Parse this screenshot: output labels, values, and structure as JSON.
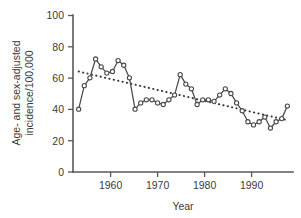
{
  "chart_data": {
    "type": "line",
    "title": "",
    "xlabel": "Year",
    "ylabel": "Age- and sex-adjusted incidence/100,000",
    "ylabel_line1": "Age- and sex-adjusted",
    "ylabel_line2": "incidence/100,000",
    "xlim": [
      1955.0,
      1994.0
    ],
    "ylim": [
      0,
      100
    ],
    "xticks": [
      1960,
      1970,
      1980,
      1990
    ],
    "xtick_labels": [
      "1960",
      "1970",
      "1980",
      "1990"
    ],
    "yticks": [
      0,
      20,
      40,
      60,
      80,
      100
    ],
    "ytick_labels": [
      "0",
      "20",
      "40",
      "60",
      "80",
      "100"
    ],
    "grid": false,
    "legend": "none",
    "marker": "open-circle",
    "series": [
      {
        "name": "Age- and sex-adjusted incidence",
        "style": "solid-line-with-open-circle-markers",
        "color": "#4a4a4c",
        "x": [
          1956,
          1957,
          1958,
          1959,
          1960,
          1961,
          1962,
          1963,
          1964,
          1965,
          1966,
          1967,
          1968,
          1969,
          1970,
          1971,
          1972,
          1973,
          1974,
          1975,
          1976,
          1977,
          1978,
          1979,
          1980,
          1981,
          1982,
          1983,
          1984,
          1985,
          1986,
          1987,
          1988,
          1989,
          1990,
          1991,
          1992,
          1993
        ],
        "values": [
          40,
          55,
          60,
          72,
          67,
          63,
          64,
          71,
          68,
          60,
          40,
          44,
          46,
          46,
          44,
          43,
          46,
          49,
          62,
          56,
          53,
          43,
          46,
          46,
          45,
          49,
          53,
          50,
          44,
          39,
          32,
          30,
          32,
          35,
          28,
          32,
          34,
          42
        ]
      },
      {
        "name": "Linear trend",
        "style": "dotted-line",
        "color": "#3a3a3c",
        "x": [
          1956,
          1993
        ],
        "values": [
          64,
          33
        ]
      }
    ]
  }
}
